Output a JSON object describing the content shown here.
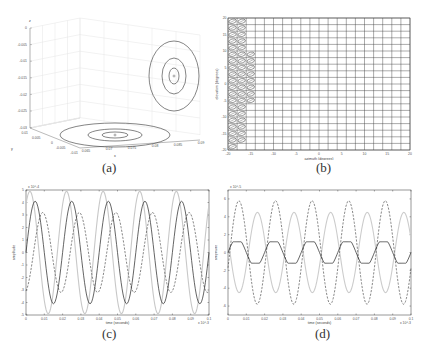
{
  "figure": {
    "panels": [
      {
        "id": "a",
        "caption": "(a)"
      },
      {
        "id": "b",
        "caption": "(b)"
      },
      {
        "id": "c",
        "caption": "(c)"
      },
      {
        "id": "d",
        "caption": "(d)"
      }
    ]
  },
  "chart_data": [
    {
      "panel": "a",
      "type": "3d-contour",
      "title": "",
      "xlabel": "x",
      "ylabel": "y",
      "zlabel": "z",
      "x_ticks": [
        "0.065",
        "0.07",
        "0.075",
        "0.08",
        "0.085",
        "0.09"
      ],
      "y_ticks": [
        "0.01",
        "0.005",
        "0",
        "-0.005",
        "-0.01"
      ],
      "z_ticks": [
        "0",
        "-0.005",
        "-0.01",
        "-0.015",
        "-0.02",
        "-0.025",
        "-0.03"
      ],
      "contours": {
        "floor_ellipses": 3,
        "wall_ellipses": 3,
        "center_marker": "o"
      },
      "grid": true
    },
    {
      "panel": "b",
      "type": "grid",
      "xlabel": "azimuth (degrees)",
      "ylabel": "elevation (degrees)",
      "xlim": [
        -20,
        20
      ],
      "ylim": [
        -20,
        20
      ],
      "x_ticks": [
        "-20",
        "-15",
        "-10",
        "-5",
        "0",
        "5",
        "10",
        "15",
        "20"
      ],
      "y_ticks": [
        "-20",
        "-15",
        "-10",
        "-5",
        "0",
        "5",
        "10",
        "15",
        "20"
      ],
      "grid_step": 2,
      "filled_columns": [
        {
          "az_from": -20,
          "az_to": -18,
          "el_from": -20,
          "el_to": 20
        },
        {
          "az_from": -18,
          "az_to": -16,
          "el_from": -18,
          "el_to": 20
        },
        {
          "az_from": -16,
          "az_to": -14,
          "el_from": -6,
          "el_to": 10
        }
      ]
    },
    {
      "panel": "c",
      "type": "line",
      "xlabel": "time (seconds)",
      "ylabel": "amplitude",
      "x_exponent": "x 10^-3",
      "y_exponent": "x 10^-4",
      "xlim": [
        0,
        0.1
      ],
      "ylim": [
        -5,
        5
      ],
      "x_ticks": [
        "0",
        "0.01",
        "0.02",
        "0.03",
        "0.04",
        "0.05",
        "0.06",
        "0.07",
        "0.08",
        "0.09",
        "0.1"
      ],
      "y_ticks": [
        "-5",
        "-4",
        "-3",
        "-2",
        "-1",
        "0",
        "1",
        "2",
        "3",
        "4",
        "5"
      ],
      "series": [
        {
          "name": "solid",
          "style": "solid",
          "color": "#222222",
          "amplitude": 4.1,
          "periods": 5,
          "phase": 0.0
        },
        {
          "name": "dashed",
          "style": "dashed",
          "color": "#555555",
          "amplitude": 3.2,
          "periods": 5,
          "phase": -1.3
        },
        {
          "name": "light",
          "style": "solid",
          "color": "#c8c8c8",
          "amplitude": 4.9,
          "periods": 5,
          "phase": 0.9
        }
      ]
    },
    {
      "panel": "d",
      "type": "line",
      "xlabel": "time (seconds)",
      "ylabel": "amplitude",
      "x_exponent": "x 10^-3",
      "y_exponent": "x 10^-5",
      "xlim": [
        0,
        0.1
      ],
      "ylim": [
        -7,
        7
      ],
      "x_ticks": [
        "0",
        "0.01",
        "0.02",
        "0.03",
        "0.04",
        "0.05",
        "0.06",
        "0.07",
        "0.08",
        "0.09",
        "0.1"
      ],
      "y_ticks": [
        "-6",
        "-4",
        "-2",
        "0",
        "2",
        "4",
        "6"
      ],
      "series": [
        {
          "name": "solid",
          "style": "solid",
          "color": "#222222",
          "amplitude": 1.2,
          "periods": 5,
          "phase": 0.0
        },
        {
          "name": "dashed",
          "style": "dashed",
          "color": "#555555",
          "amplitude": 5.8,
          "periods": 5,
          "phase": -0.3
        },
        {
          "name": "light",
          "style": "solid",
          "color": "#cccccc",
          "amplitude": 4.5,
          "periods": 5,
          "phase": 2.8
        }
      ]
    }
  ]
}
